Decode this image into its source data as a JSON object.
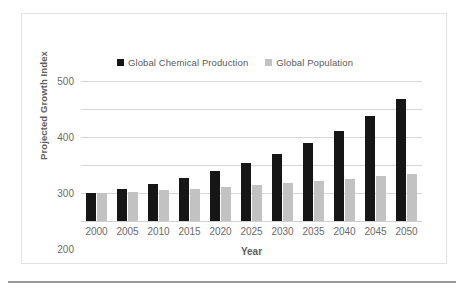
{
  "chart_data": {
    "type": "bar",
    "title": "",
    "xlabel": "Year",
    "ylabel": "Projected Growth Index",
    "categories": [
      "2000",
      "2005",
      "2010",
      "2015",
      "2020",
      "2025",
      "2030",
      "2035",
      "2040",
      "2045",
      "2050"
    ],
    "series": [
      {
        "name": "Global Chemical Production",
        "color": "#161616",
        "values": [
          100,
          115,
          132,
          153,
          179,
          208,
          240,
          279,
          323,
          375,
          435
        ]
      },
      {
        "name": "Global Population",
        "color": "#c2c2c2",
        "values": [
          100,
          105,
          110,
          115,
          121,
          128,
          135,
          142,
          150,
          159,
          168
        ]
      }
    ],
    "ylim": [
      0,
      500
    ],
    "yticks": [
      0,
      100,
      200,
      300,
      400,
      500
    ],
    "ytick_labels": [
      "0",
      "100",
      "200",
      "300",
      "400",
      "500"
    ],
    "grid": true,
    "legend_position": "top-center"
  }
}
